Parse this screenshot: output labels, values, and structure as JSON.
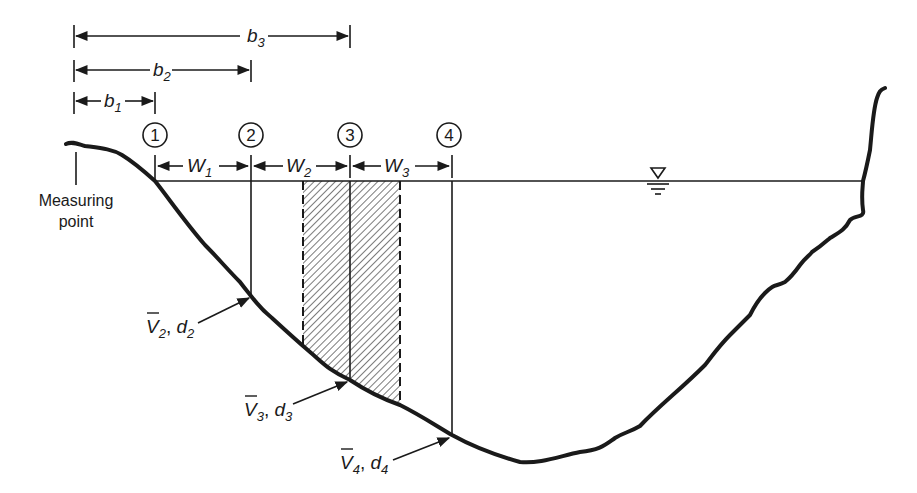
{
  "diagram": {
    "measuring_point_label": [
      "Measuring",
      "point"
    ],
    "stations": [
      {
        "id": "1",
        "x": 155
      },
      {
        "id": "2",
        "x": 251
      },
      {
        "id": "3",
        "x": 350
      },
      {
        "id": "4",
        "x": 452
      }
    ],
    "distances": [
      {
        "label": "b",
        "sub": "1",
        "from": 74,
        "to": 155,
        "y": 101
      },
      {
        "label": "b",
        "sub": "2",
        "from": 74,
        "to": 251,
        "y": 70
      },
      {
        "label": "b",
        "sub": "3",
        "from": 74,
        "to": 350,
        "y": 36
      }
    ],
    "widths": [
      {
        "label": "W",
        "sub": "1",
        "from": 155,
        "to": 251
      },
      {
        "label": "W",
        "sub": "2",
        "from": 251,
        "to": 350
      },
      {
        "label": "W",
        "sub": "3",
        "from": 350,
        "to": 452
      }
    ],
    "verticals": [
      {
        "label": "V",
        "sub": "2",
        "depth": "d",
        "dsub": "2"
      },
      {
        "label": "V",
        "sub": "3",
        "depth": "d",
        "dsub": "3"
      },
      {
        "label": "V",
        "sub": "4",
        "depth": "d",
        "dsub": "4"
      }
    ],
    "water_surface_symbol": "water-surface-triangle",
    "colors": {
      "line": "#1a1a1a",
      "background": "#ffffff"
    }
  }
}
